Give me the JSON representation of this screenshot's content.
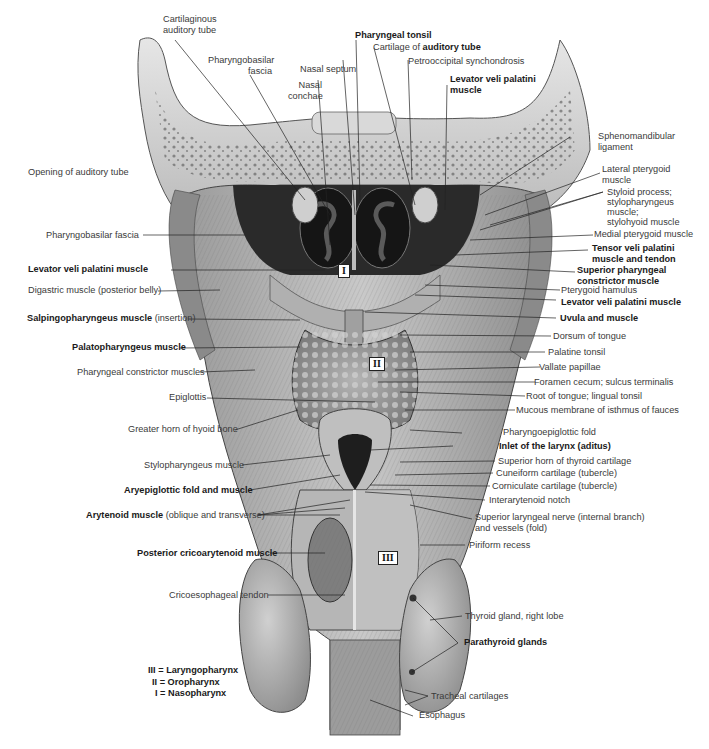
{
  "figure": {
    "palette": {
      "background": "#ffffff",
      "text": "#3a3a3a",
      "bold_text": "#1a1a1a",
      "leader_line": "#222222",
      "tissue_light": "#d8d8d8",
      "tissue_mid": "#a8a8a8",
      "tissue_dark": "#4a4a4a",
      "cavity": "#1e1e1e"
    }
  },
  "labels": {
    "top": [
      {
        "id": "cartilaginous-auditory-tube",
        "text": "Cartilaginous auditory tube",
        "line1": "Cartilaginous",
        "line2": "auditory tube",
        "bold": false
      },
      {
        "id": "pharyngobasilar-fascia-top",
        "text": "Pharyngobasilar fascia",
        "line1": "Pharyngobasilar",
        "line2": "fascia",
        "bold": false
      },
      {
        "id": "nasal-septum",
        "text": "Nasal septum",
        "bold": false
      },
      {
        "id": "nasal-conchae",
        "text": "Nasal conchae",
        "line1": "Nasal",
        "line2": "conchae",
        "bold": false
      },
      {
        "id": "pharyngeal-tonsil",
        "text": "Pharyngeal tonsil",
        "bold": true
      },
      {
        "id": "cartilage-of-auditory-tube",
        "prefix": "Cartilage of ",
        "bold_part": "auditory tube"
      },
      {
        "id": "petrooccipital-synchondrosis",
        "text": "Petrooccipital synchondrosis",
        "bold": false
      },
      {
        "id": "levator-veli-palatini-top",
        "text": "Levator veli palatini muscle",
        "line1": "Levator veli palatini",
        "line2": "muscle",
        "bold": true
      }
    ],
    "left": [
      {
        "id": "opening-of-auditory-tube",
        "text": "Opening of auditory tube",
        "bold": false
      },
      {
        "id": "pharyngobasilar-fascia-left",
        "text": "Pharyngobasilar fascia",
        "bold": false
      },
      {
        "id": "levator-veli-palatini-left",
        "text": "Levator veli palatini muscle",
        "bold": true
      },
      {
        "id": "digastric-muscle",
        "text": "Digastric muscle (posterior belly)",
        "bold": false
      },
      {
        "id": "salpingopharyngeus",
        "bold_part": "Salpingopharyngeus muscle",
        "suffix": " (insertion)"
      },
      {
        "id": "palatopharyngeus",
        "text": "Palatopharyngeus muscle",
        "bold": true
      },
      {
        "id": "pharyngeal-constrictor-muscles",
        "text": "Pharyngeal constrictor muscles",
        "bold": false
      },
      {
        "id": "epiglottis",
        "text": "Epiglottis",
        "bold": false
      },
      {
        "id": "greater-horn-hyoid",
        "text": "Greater horn of hyoid bone",
        "bold": false
      },
      {
        "id": "stylopharyngeus-muscle",
        "text": "Stylopharyngeus muscle",
        "bold": false
      },
      {
        "id": "aryepiglottic-fold",
        "text": "Aryepiglottic fold and muscle",
        "bold": true
      },
      {
        "id": "arytenoid-muscle",
        "bold_part": "Arytenoid muscle",
        "suffix": " (oblique and transverse)"
      },
      {
        "id": "posterior-cricoarytenoid",
        "text": "Posterior cricoarytenoid muscle",
        "bold": true
      },
      {
        "id": "cricoesophageal-tendon",
        "text": "Cricoesophageal tendon",
        "bold": false
      }
    ],
    "right": [
      {
        "id": "sphenomandibular-ligament",
        "text": "Sphenomandibular ligament",
        "line1": "Sphenomandibular",
        "line2": "ligament",
        "bold": false
      },
      {
        "id": "lateral-pterygoid",
        "text": "Lateral pterygoid muscle",
        "line1": "Lateral pterygoid",
        "line2": "muscle",
        "bold": false
      },
      {
        "id": "styloid-process",
        "text": "Styloid process; stylopharyngeus muscle; stylohyoid muscle",
        "line1": "Styloid process;",
        "line2": "stylopharyngeus",
        "line3": "muscle;",
        "line4": "stylohyoid muscle",
        "bold": false
      },
      {
        "id": "medial-pterygoid",
        "text": "Medial pterygoid muscle",
        "bold": false
      },
      {
        "id": "tensor-veli-palatini",
        "text": "Tensor veli palatini muscle and tendon",
        "line1": "Tensor veli palatini",
        "line2": "muscle and tendon",
        "bold": true
      },
      {
        "id": "superior-pharyngeal-constrictor",
        "text": "Superior pharyngeal constrictor muscle",
        "line1": "Superior pharyngeal",
        "line2": "constrictor muscle",
        "bold": true
      },
      {
        "id": "pterygoid-hamulus",
        "text": "Pterygoid hamulus",
        "bold": false
      },
      {
        "id": "levator-veli-palatini-right",
        "text": "Levator veli palatini muscle",
        "bold": true
      },
      {
        "id": "uvula-and-muscle",
        "text": "Uvula and muscle",
        "bold": true
      },
      {
        "id": "dorsum-of-tongue",
        "text": "Dorsum of tongue",
        "bold": false
      },
      {
        "id": "palatine-tonsil",
        "text": "Palatine tonsil",
        "bold": false
      },
      {
        "id": "vallate-papillae",
        "text": "Vallate papillae",
        "bold": false
      },
      {
        "id": "foramen-cecum",
        "text": "Foramen cecum; sulcus terminalis",
        "bold": false
      },
      {
        "id": "root-of-tongue",
        "text": "Root of tongue; lingual tonsil",
        "bold": false
      },
      {
        "id": "mucous-membrane-isthmus",
        "text": "Mucous membrane of isthmus of fauces",
        "bold": false
      },
      {
        "id": "pharyngoepiglottic-fold",
        "text": "Pharyngoepiglottic fold",
        "bold": false
      },
      {
        "id": "inlet-of-larynx",
        "text": "Inlet of the larynx (aditus)",
        "bold": true
      },
      {
        "id": "superior-horn-thyroid",
        "text": "Superior horn of thyroid cartilage",
        "bold": false
      },
      {
        "id": "cuneiform-cartilage",
        "text": "Cuneiform cartilage (tubercle)",
        "bold": false
      },
      {
        "id": "corniculate-cartilage",
        "text": "Corniculate cartilage (tubercle)",
        "bold": false
      },
      {
        "id": "interarytenoid-notch",
        "text": "Interarytenoid notch",
        "bold": false
      },
      {
        "id": "superior-laryngeal-nerve",
        "text": "Superior laryngeal nerve (internal branch) and vessels (fold)",
        "line1": "Superior laryngeal nerve (internal branch)",
        "line2": "and vessels (fold)",
        "bold": false
      },
      {
        "id": "piriform-recess",
        "text": "Piriform recess",
        "bold": false
      },
      {
        "id": "thyroid-gland",
        "text": "Thyroid gland, right lobe",
        "bold": false
      },
      {
        "id": "parathyroid-glands",
        "text": "Parathyroid glands",
        "bold": true
      },
      {
        "id": "tracheal-cartilages",
        "text": "Tracheal cartilages",
        "bold": false
      },
      {
        "id": "esophagus",
        "text": "Esophagus",
        "bold": false
      }
    ]
  },
  "region_markers": [
    {
      "numeral": "I",
      "region": "Nasopharynx"
    },
    {
      "numeral": "II",
      "region": "Oropharynx"
    },
    {
      "numeral": "III",
      "region": "Laryngopharynx"
    }
  ],
  "legend": [
    {
      "text": "III = Laryngopharynx"
    },
    {
      "text": "II = Oropharynx"
    },
    {
      "text": "I = Nasopharynx"
    }
  ]
}
